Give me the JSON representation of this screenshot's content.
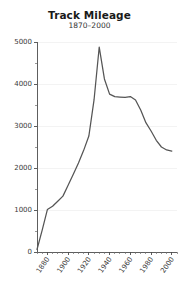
{
  "chart_data": {
    "type": "line",
    "title": "Track Mileage",
    "subtitle": "1870–2000",
    "xlabel": "",
    "ylabel": "",
    "xlim": [
      1870,
      2005
    ],
    "ylim": [
      0,
      5000
    ],
    "grid": "faint-horizontal",
    "legend": "none",
    "line_color": "#555555",
    "x": [
      1870,
      1875,
      1880,
      1885,
      1890,
      1895,
      1900,
      1905,
      1910,
      1915,
      1920,
      1925,
      1930,
      1935,
      1940,
      1945,
      1950,
      1955,
      1960,
      1965,
      1970,
      1975,
      1980,
      1985,
      1990,
      1995,
      2000
    ],
    "values": [
      60,
      520,
      1010,
      1090,
      1210,
      1330,
      1590,
      1850,
      2120,
      2420,
      2760,
      3620,
      4880,
      4120,
      3760,
      3700,
      3690,
      3680,
      3700,
      3620,
      3380,
      3080,
      2880,
      2660,
      2500,
      2430,
      2400
    ],
    "series": [
      {
        "name": "Track Mileage",
        "values": [
          60,
          520,
          1010,
          1090,
          1210,
          1330,
          1590,
          1850,
          2120,
          2420,
          2760,
          3620,
          4880,
          4120,
          3760,
          3700,
          3690,
          3680,
          3700,
          3620,
          3380,
          3080,
          2880,
          2660,
          2500,
          2430,
          2400
        ]
      }
    ],
    "yticks": [
      0,
      1000,
      2000,
      3000,
      4000,
      5000
    ],
    "ytick_labels": [
      "0",
      "1000",
      "2000",
      "3000",
      "4000",
      "5000"
    ],
    "xticks": [
      1880,
      1900,
      1920,
      1940,
      1960,
      1980,
      2000
    ],
    "xtick_labels": [
      "1880",
      "1900",
      "1920",
      "1940",
      "1960",
      "1980",
      "2000"
    ],
    "xticks_minor": [
      1870,
      1875,
      1885,
      1890,
      1895,
      1905,
      1910,
      1915,
      1925,
      1930,
      1935,
      1945,
      1950,
      1955,
      1965,
      1970,
      1975,
      1985,
      1990,
      1995,
      2005
    ],
    "yticks_minor": [
      500,
      1500,
      2500,
      3500,
      4500
    ],
    "peak": {
      "x": 1930,
      "y": 4880
    }
  }
}
